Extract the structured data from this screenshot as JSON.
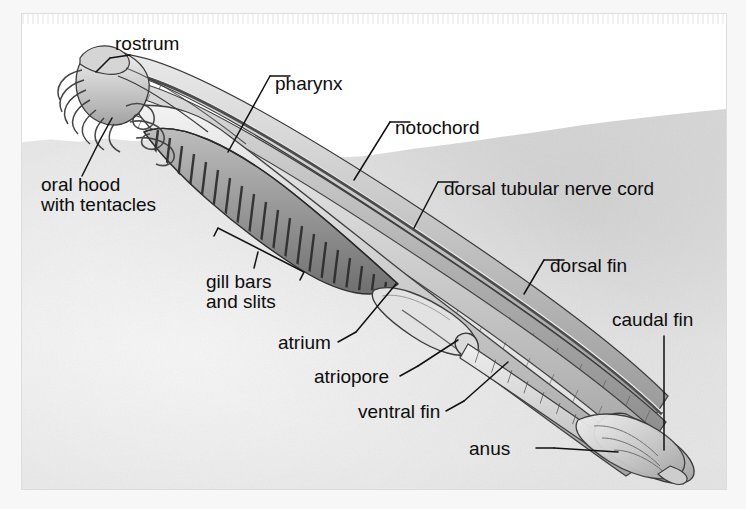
{
  "figure": {
    "background_color": "#ffffff",
    "sediment_color": "#e6e6e6",
    "ink_color": "#0d0d0d",
    "body_fill": "#c9c9c9"
  },
  "labels": [
    {
      "id": "rostrum",
      "text": "rostrum",
      "x": 115,
      "y": 34,
      "lines": [
        "rostrum"
      ]
    },
    {
      "id": "pharynx",
      "text": "pharynx",
      "x": 275,
      "y": 74,
      "lines": [
        "pharynx"
      ]
    },
    {
      "id": "notochord",
      "text": "notochord",
      "x": 395,
      "y": 118,
      "lines": [
        "notochord"
      ]
    },
    {
      "id": "oral-hood",
      "text": "oral hood with tentacles",
      "x": 41,
      "y": 175,
      "lines": [
        "oral hood",
        "with tentacles"
      ]
    },
    {
      "id": "dorsal-nerve-cord",
      "text": "dorsal tubular nerve cord",
      "x": 444,
      "y": 179,
      "lines": [
        "dorsal tubular nerve cord"
      ]
    },
    {
      "id": "dorsal-fin",
      "text": "dorsal fin",
      "x": 550,
      "y": 256,
      "lines": [
        "dorsal fin"
      ]
    },
    {
      "id": "gill-bars",
      "text": "gill bars and slits",
      "x": 206,
      "y": 272,
      "lines": [
        "gill bars",
        "and slits"
      ]
    },
    {
      "id": "caudal-fin",
      "text": "caudal fin",
      "x": 612,
      "y": 310,
      "lines": [
        "caudal fin"
      ]
    },
    {
      "id": "atrium",
      "text": "atrium",
      "x": 278,
      "y": 335,
      "lines": [
        "atrium"
      ]
    },
    {
      "id": "atriopore",
      "text": "atriopore",
      "x": 314,
      "y": 369,
      "lines": [
        "atriopore"
      ]
    },
    {
      "id": "ventral-fin",
      "text": "ventral fin",
      "x": 358,
      "y": 404,
      "lines": [
        "ventral fin"
      ]
    },
    {
      "id": "anus",
      "text": "anus",
      "x": 469,
      "y": 441,
      "lines": [
        "anus"
      ]
    }
  ],
  "label_text": {
    "rostrum": "rostrum",
    "pharynx": "pharynx",
    "notochord": "notochord",
    "oral_hood_line1": "oral hood",
    "oral_hood_line2": "with tentacles",
    "dorsal_nerve_cord": "dorsal tubular nerve cord",
    "dorsal_fin": "dorsal fin",
    "gill_bars_line1": "gill bars",
    "gill_bars_line2": "and slits",
    "caudal_fin": "caudal fin",
    "atrium": "atrium",
    "atriopore": "atriopore",
    "ventral_fin": "ventral fin",
    "anus": "anus"
  }
}
